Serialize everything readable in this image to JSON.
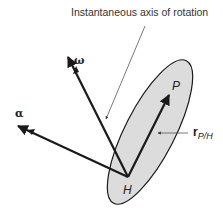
{
  "figure": {
    "caption": "Instantaneous axis of rotation",
    "labels": {
      "omega": "ω",
      "alpha": "α",
      "point_p": "P",
      "point_h": "H",
      "position_vector": "r",
      "position_vector_subscript": "P/H"
    },
    "colors": {
      "body_fill": "#dcdcdc",
      "stroke": "#1a1a1a",
      "leader": "#555555"
    }
  }
}
